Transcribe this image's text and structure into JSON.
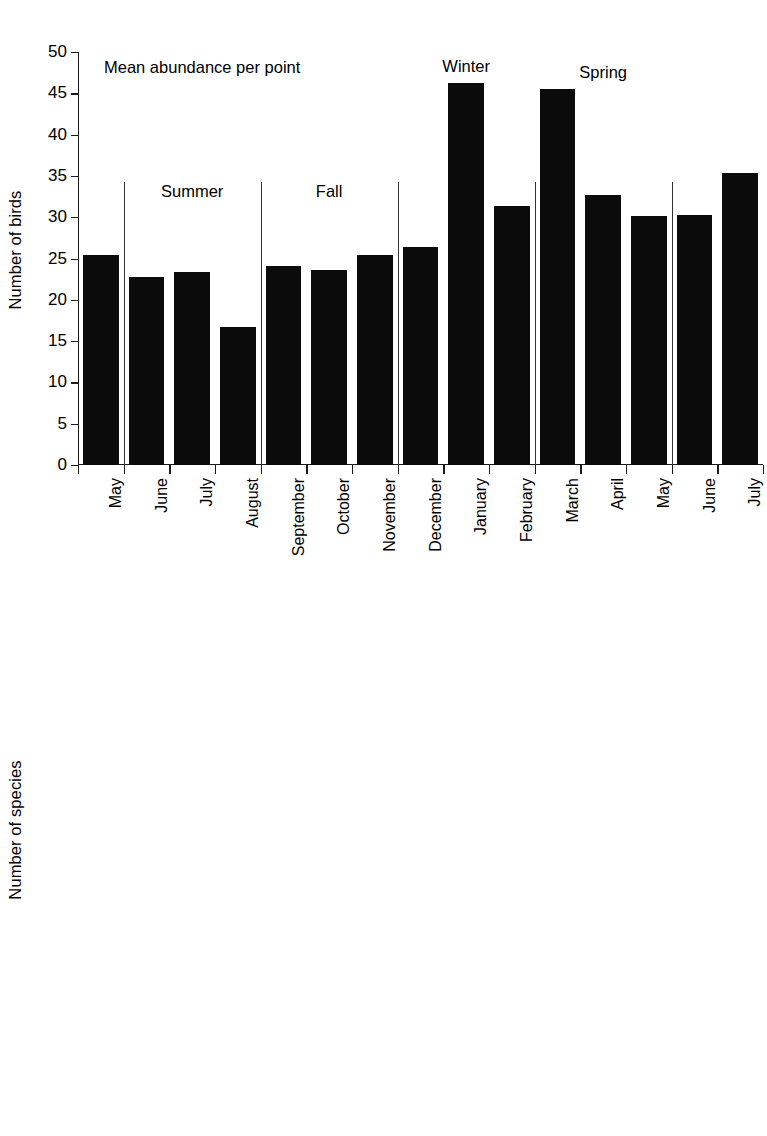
{
  "chart_data": [
    {
      "type": "bar",
      "id": "mean-abundance-per-point",
      "title": "Mean abundance per point",
      "xlabel": "",
      "ylabel": "Number of birds",
      "ylim": [
        0,
        50
      ],
      "yticks": [
        0,
        5,
        10,
        15,
        20,
        25,
        30,
        35,
        40,
        45,
        50
      ],
      "grid": false,
      "legend": "none",
      "bar_color": "#0b0b0b",
      "categories": [
        "May",
        "June",
        "July",
        "August",
        "September",
        "October",
        "November",
        "December",
        "January",
        "February",
        "March",
        "April",
        "May",
        "June",
        "July"
      ],
      "values": [
        25.4,
        22.8,
        23.4,
        16.7,
        24.1,
        23.6,
        25.4,
        26.4,
        46.2,
        31.4,
        45.5,
        32.7,
        30.1,
        30.3,
        35.3
      ],
      "season_labels": [
        {
          "text": "Summer",
          "after_category_index": 1,
          "span": [
            1,
            3
          ]
        },
        {
          "text": "Fall",
          "after_category_index": 4,
          "span": [
            4,
            6
          ]
        },
        {
          "text": "Winter",
          "after_category_index": 7,
          "span": [
            7,
            9
          ]
        },
        {
          "text": "Spring",
          "after_category_index": 10,
          "span": [
            10,
            12
          ]
        }
      ],
      "dividers_after_index": [
        0,
        3,
        6,
        9,
        12
      ]
    },
    {
      "type": "bar",
      "id": "mean-richness-per-point",
      "title": "Mean richness per point",
      "xlabel": "",
      "ylabel": "Number of species",
      "ylim": [
        0,
        12
      ],
      "yticks": [
        0,
        2,
        4,
        6,
        8,
        10,
        12
      ],
      "grid": false,
      "legend": "none",
      "bar_color": "#0b0b0b",
      "categories": [
        "May",
        "June",
        "July",
        "August",
        "September",
        "October",
        "November",
        "December",
        "January",
        "February",
        "March",
        "April",
        "May",
        "June",
        "July"
      ],
      "values": [
        10.35,
        9.95,
        8.85,
        5.7,
        7.75,
        6.85,
        5.75,
        6.8,
        6.9,
        7.35,
        8.6,
        11.2,
        11.4,
        11.45,
        10.5
      ],
      "season_labels": [
        {
          "text": "Summer",
          "after_category_index": 1,
          "span": [
            1,
            3
          ]
        },
        {
          "text": "Fall",
          "after_category_index": 4,
          "span": [
            4,
            6
          ]
        },
        {
          "text": "Winter",
          "after_category_index": 7,
          "span": [
            7,
            9
          ]
        },
        {
          "text": "Spring",
          "after_category_index": 10,
          "span": [
            10,
            12
          ]
        }
      ],
      "dividers_after_index": [
        0,
        3,
        6,
        9,
        12
      ]
    }
  ]
}
